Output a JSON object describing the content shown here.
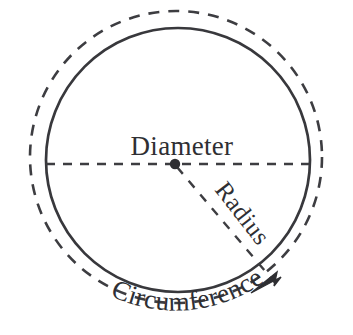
{
  "figure": {
    "kind": "geometry-diagram",
    "background_color": "#ffffff",
    "ink_color": "#3a3a3e",
    "solid_stroke_color": "#38383c",
    "dashed_stroke_color": "#3d3d41",
    "text_color": "#2f2f33"
  },
  "labels": {
    "diameter": "Diameter",
    "radius": "Radius",
    "circumference": "Circumference"
  },
  "geometry": {
    "solid_circle": {
      "cx": 178,
      "cy": 160,
      "r": 132,
      "stroke_width": 2.6
    },
    "dashed_circle": {
      "cx": 176,
      "cy": 157,
      "r": 146,
      "stroke_width": 2.6,
      "dash": "11 9"
    },
    "center_dot": {
      "cx": 175,
      "cy": 164,
      "r": 5
    },
    "diameter_line": {
      "x1": 46,
      "y1": 164,
      "x2": 309,
      "y2": 164,
      "dash": "9 8",
      "stroke_width": 2.4
    },
    "radius_line": {
      "x1": 176,
      "y1": 166,
      "x2": 268,
      "y2": 275,
      "dash": "9 9",
      "stroke_width": 2.4
    },
    "arrow_tip": {
      "x": 252,
      "y": 293
    },
    "arrow_angle_deg": 222,
    "circumference_text_arc": {
      "cx": 178,
      "cy": 160,
      "r": 152,
      "start_deg": 118,
      "end_deg": 56
    },
    "radius_text_rotation_deg": 52
  }
}
